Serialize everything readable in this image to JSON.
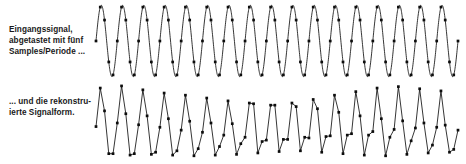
{
  "figure": {
    "background_color": "#ffffff",
    "ink_color": "#121212",
    "captions": {
      "top": "Eingangssignal,\nabgetastet mit fünf\nSamples/Periode ...",
      "bottom": "... und die rekonstru-\nierte Signalform."
    }
  },
  "chart_data": [
    {
      "type": "line",
      "name": "input-signal",
      "title": "Eingangssignal, abgetastet mit fünf Samples/Periode ...",
      "xlabel": "",
      "ylabel": "",
      "grid": false,
      "legend": "none",
      "axis_visible": false,
      "signal": {
        "waveform": "sine",
        "cycles": 17,
        "amplitude": 1,
        "phase_deg": -90,
        "rendering": "smooth-continuous-curve"
      },
      "sampling": {
        "samples_per_period": 5,
        "total_samples": 86,
        "marker": "filled-square-dot"
      },
      "xlim": [
        0,
        17
      ],
      "ylim": [
        -1.15,
        1.15
      ],
      "x": [
        0,
        0.2,
        0.4,
        0.6,
        0.8,
        1,
        1.2,
        1.4,
        1.6,
        1.8,
        2,
        2.2,
        2.4,
        2.6,
        2.8,
        3,
        3.2,
        3.4,
        3.6,
        3.8,
        4,
        4.2,
        4.4,
        4.6,
        4.8,
        5,
        5.2,
        5.4,
        5.6,
        5.8,
        6,
        6.2,
        6.4,
        6.6,
        6.8,
        7,
        7.2,
        7.4,
        7.6,
        7.8,
        8,
        8.2,
        8.4,
        8.6,
        8.8,
        9,
        9.2,
        9.4,
        9.6,
        9.8,
        10,
        10.2,
        10.4,
        10.6,
        10.8,
        11,
        11.2,
        11.4,
        11.6,
        11.8,
        12,
        12.2,
        12.4,
        12.6,
        12.8,
        13,
        13.2,
        13.4,
        13.6,
        13.8,
        14,
        14.2,
        14.4,
        14.6,
        14.8,
        15,
        15.2,
        15.4,
        15.6,
        15.8,
        16,
        16.2,
        16.4,
        16.6,
        16.8,
        17
      ],
      "values": [
        0,
        0.951,
        0.588,
        -0.588,
        -0.951,
        0,
        0.951,
        0.588,
        -0.588,
        -0.951,
        0,
        0.951,
        0.588,
        -0.588,
        -0.951,
        0,
        0.951,
        0.588,
        -0.588,
        -0.951,
        0,
        0.951,
        0.588,
        -0.588,
        -0.951,
        0,
        0.951,
        0.588,
        -0.588,
        -0.951,
        0,
        0.951,
        0.588,
        -0.588,
        -0.951,
        0,
        0.951,
        0.588,
        -0.588,
        -0.951,
        0,
        0.951,
        0.588,
        -0.588,
        -0.951,
        0,
        0.951,
        0.588,
        -0.588,
        -0.951,
        0,
        0.951,
        0.588,
        -0.588,
        -0.951,
        0,
        0.951,
        0.588,
        -0.588,
        -0.951,
        0,
        0.951,
        0.588,
        -0.588,
        -0.951,
        0,
        0.951,
        0.588,
        -0.588,
        -0.951,
        0,
        0.951,
        0.588,
        -0.588,
        -0.951,
        0,
        0.951,
        0.588,
        -0.588,
        -0.951,
        0,
        0.951,
        0.588,
        -0.588,
        -0.951,
        0
      ]
    },
    {
      "type": "line",
      "name": "reconstructed-signal",
      "title": "... und die rekonstruierte Signalform.",
      "xlabel": "",
      "ylabel": "",
      "grid": false,
      "legend": "none",
      "axis_visible": false,
      "signal": {
        "waveform": "piecewise-linear reconstruction from samples",
        "cycles": 17,
        "rendering": "straight-segments-between-samples",
        "artifact": "beat/aliasing amplitude modulation"
      },
      "sampling": {
        "samples_per_period": 5,
        "total_samples": 86,
        "marker": "filled-square-dot"
      },
      "xlim": [
        0,
        17
      ],
      "ylim": [
        -1.15,
        1.15
      ],
      "x": [
        0,
        0.2,
        0.4,
        0.6,
        0.8,
        1,
        1.2,
        1.4,
        1.6,
        1.8,
        2,
        2.2,
        2.4,
        2.6,
        2.8,
        3,
        3.2,
        3.4,
        3.6,
        3.8,
        4,
        4.2,
        4.4,
        4.6,
        4.8,
        5,
        5.2,
        5.4,
        5.6,
        5.8,
        6,
        6.2,
        6.4,
        6.6,
        6.8,
        7,
        7.2,
        7.4,
        7.6,
        7.8,
        8,
        8.2,
        8.4,
        8.6,
        8.8,
        9,
        9.2,
        9.4,
        9.6,
        9.8,
        10,
        10.2,
        10.4,
        10.6,
        10.8,
        11,
        11.2,
        11.4,
        11.6,
        11.8,
        12,
        12.2,
        12.4,
        12.6,
        12.8,
        13,
        13.2,
        13.4,
        13.6,
        13.8,
        14,
        14.2,
        14.4,
        14.6,
        14.8,
        15,
        15.2,
        15.4,
        15.6,
        15.8,
        16,
        16.2,
        16.4,
        16.6,
        16.8,
        17
      ],
      "values": [
        -0.1,
        0.98,
        0.34,
        -0.86,
        -0.86,
        0.0,
        1.04,
        0.26,
        -0.9,
        -0.86,
        -0.05,
        0.93,
        0.2,
        -0.88,
        -0.82,
        -0.12,
        0.84,
        0.12,
        -0.9,
        -0.78,
        -0.2,
        0.78,
        0.05,
        -0.92,
        -0.72,
        -0.26,
        0.7,
        0.0,
        -0.9,
        -0.66,
        -0.34,
        0.62,
        -0.02,
        -0.88,
        -0.58,
        -0.4,
        0.56,
        0.54,
        -0.84,
        -0.52,
        -0.48,
        0.5,
        0.5,
        -0.8,
        -0.46,
        -0.46,
        0.56,
        0.46,
        -0.78,
        -0.4,
        -0.42,
        0.66,
        0.4,
        -0.82,
        -0.38,
        -0.36,
        0.78,
        0.3,
        -0.86,
        -0.34,
        -0.3,
        0.88,
        0.2,
        -0.9,
        -0.34,
        -0.24,
        0.98,
        0.12,
        -0.92,
        -0.4,
        -0.18,
        1.02,
        0.06,
        -0.88,
        -0.5,
        -0.14,
        0.96,
        0.0,
        -0.84,
        -0.62,
        -0.12,
        0.9,
        -0.06,
        -0.82,
        -0.74,
        -0.2
      ]
    }
  ]
}
